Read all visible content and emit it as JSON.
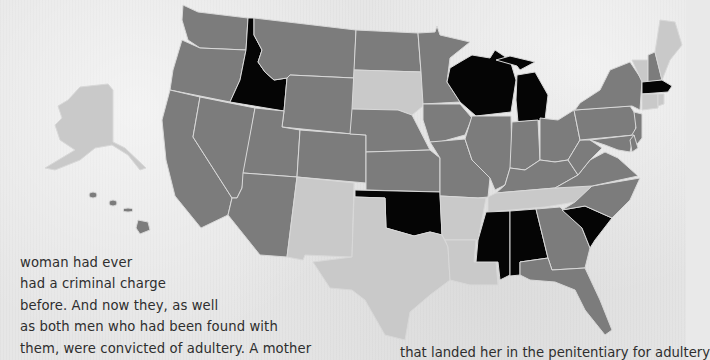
{
  "colors": {
    "black": "#050505",
    "mid_gray": "#7c7c7c",
    "light_gray": "#c9c9c9",
    "background": "#e6e6e6",
    "border": "#d8d8d8",
    "text": "#2e2e2e"
  },
  "map": {
    "type": "choropleth",
    "region": "United States",
    "legend": null,
    "shading_groups": {
      "black": [
        "Idaho",
        "Wisconsin",
        "Michigan",
        "Massachusetts",
        "Oklahoma",
        "Mississippi",
        "Alabama",
        "South Carolina"
      ],
      "light_gray": [
        "Alaska",
        "South Dakota",
        "New Mexico",
        "Texas",
        "Arkansas",
        "Louisiana",
        "Tennessee",
        "Maine",
        "Vermont",
        "Connecticut",
        "Rhode Island"
      ],
      "mid_gray": [
        "Washington",
        "Oregon",
        "California",
        "Nevada",
        "Montana",
        "Wyoming",
        "Utah",
        "Arizona",
        "Colorado",
        "North Dakota",
        "Nebraska",
        "Kansas",
        "Minnesota",
        "Iowa",
        "Missouri",
        "Illinois",
        "Indiana",
        "Ohio",
        "Kentucky",
        "Georgia",
        "Florida",
        "North Carolina",
        "Virginia",
        "West Virginia",
        "Pennsylvania",
        "New York",
        "New Jersey",
        "Delaware",
        "Maryland",
        "New Hampshire",
        "Hawaii"
      ]
    }
  },
  "article": {
    "left_lines": [
      "woman had ever",
      "had a criminal charge",
      "before. And now they, as well",
      "as both men who had been found with",
      "them, were convicted of adultery. A mother"
    ],
    "right_line": "that landed her in the penitentiary for adultery"
  }
}
